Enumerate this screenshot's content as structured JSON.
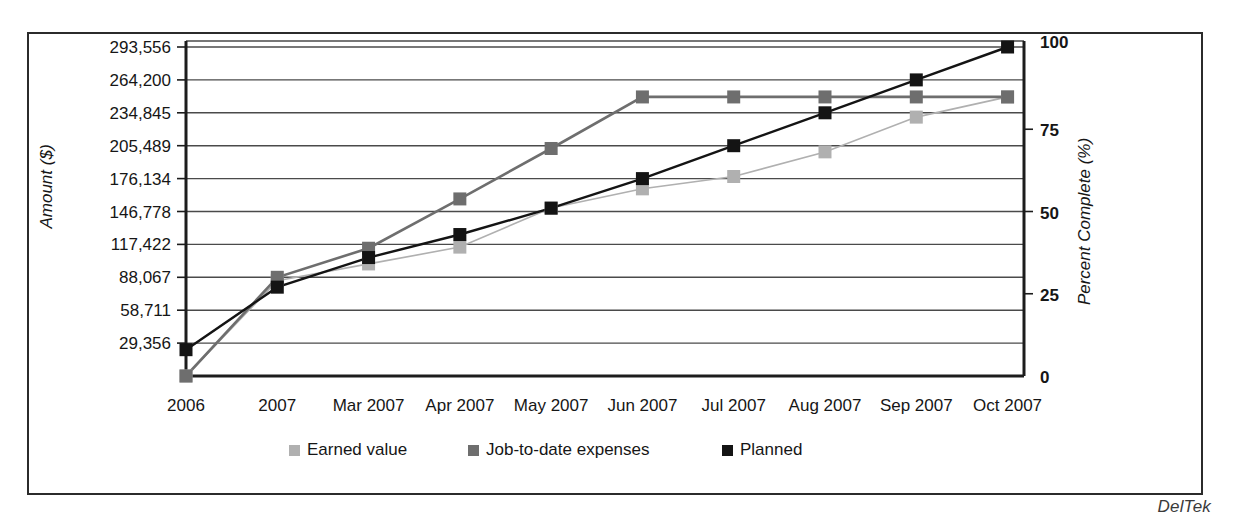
{
  "watermark": "DelTek",
  "chart_data": {
    "type": "line",
    "title": "",
    "xlabel": "",
    "ylabel": "Amount ($)",
    "y2label": "Percent Complete (%)",
    "categories": [
      "2006",
      "2007",
      "Mar 2007",
      "Apr 2007",
      "May 2007",
      "Jun 2007",
      "Jul 2007",
      "Aug 2007",
      "Sep 2007",
      "Oct 2007"
    ],
    "ylim": [
      0,
      293556
    ],
    "ytick_labels": [
      "293,556",
      "264,200",
      "234,845",
      "205,489",
      "176,134",
      "146,778",
      "117,422",
      "88,067",
      "58,711",
      "29,356"
    ],
    "ytick_values": [
      293556,
      264200,
      234845,
      205489,
      176134,
      146778,
      117422,
      88067,
      58711,
      29356
    ],
    "y2lim": [
      0,
      100
    ],
    "y2tick_labels": [
      "100",
      "75",
      "50",
      "25",
      "0"
    ],
    "y2tick_values": [
      100,
      75,
      50,
      25,
      0
    ],
    "grid": true,
    "legend_position": "bottom",
    "series": [
      {
        "name": "Earned value",
        "color": "#b0b0b0",
        "marker": "square",
        "values": [
          0,
          85000,
          100000,
          115000,
          150000,
          167000,
          178000,
          200000,
          231000,
          249000
        ]
      },
      {
        "name": "Job-to-date expenses",
        "color": "#6e6e6e",
        "marker": "square",
        "values": [
          0,
          88067,
          114000,
          158000,
          203000,
          249000,
          249000,
          249000,
          249000,
          249000
        ]
      },
      {
        "name": "Planned",
        "color": "#141414",
        "marker": "square",
        "values": [
          8,
          27,
          36,
          43,
          51,
          60,
          70,
          80,
          90,
          100
        ],
        "axis": "percent"
      }
    ]
  }
}
